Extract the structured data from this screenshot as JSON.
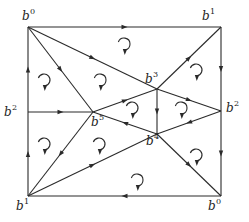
{
  "diagram": {
    "type": "directed planar graph with oriented faces",
    "vertices": [
      {
        "id": "tl",
        "label": "b",
        "sup": "0"
      },
      {
        "id": "tr",
        "label": "b",
        "sup": "1"
      },
      {
        "id": "ml",
        "label": "b",
        "sup": "2"
      },
      {
        "id": "mr",
        "label": "b",
        "sup": "2"
      },
      {
        "id": "bl",
        "label": "b",
        "sup": "1"
      },
      {
        "id": "br",
        "label": "b",
        "sup": "0"
      },
      {
        "id": "c3",
        "label": "b",
        "sup": "3"
      },
      {
        "id": "c5",
        "label": "b",
        "sup": "5"
      },
      {
        "id": "c4",
        "label": "b",
        "sup": "4"
      }
    ],
    "edges": [
      {
        "from": "tl",
        "to": "tr"
      },
      {
        "from": "tr",
        "to": "mr"
      },
      {
        "from": "mr",
        "to": "br"
      },
      {
        "from": "br",
        "to": "bl"
      },
      {
        "from": "bl",
        "to": "ml"
      },
      {
        "from": "ml",
        "to": "tl"
      },
      {
        "from": "tl",
        "to": "c3"
      },
      {
        "from": "tl",
        "to": "c5"
      },
      {
        "from": "c3",
        "to": "tr"
      },
      {
        "from": "ml",
        "to": "c5"
      },
      {
        "from": "c5",
        "to": "c3"
      },
      {
        "from": "c4",
        "to": "c5"
      },
      {
        "from": "c3",
        "to": "c4"
      },
      {
        "from": "c3",
        "to": "mr"
      },
      {
        "from": "mr",
        "to": "c4"
      },
      {
        "from": "c5",
        "to": "bl"
      },
      {
        "from": "bl",
        "to": "c4"
      },
      {
        "from": "c4",
        "to": "br"
      }
    ],
    "faces": [
      {
        "name": "top",
        "orientation": "clockwise"
      },
      {
        "name": "upper-left",
        "orientation": "clockwise"
      },
      {
        "name": "left-top",
        "orientation": "clockwise"
      },
      {
        "name": "upper-right",
        "orientation": "clockwise"
      },
      {
        "name": "center",
        "orientation": "clockwise"
      },
      {
        "name": "right-inner",
        "orientation": "clockwise"
      },
      {
        "name": "left-bottom",
        "orientation": "clockwise"
      },
      {
        "name": "lower-middle",
        "orientation": "clockwise"
      },
      {
        "name": "right-lower",
        "orientation": "clockwise"
      },
      {
        "name": "bottom",
        "orientation": "clockwise"
      }
    ]
  }
}
